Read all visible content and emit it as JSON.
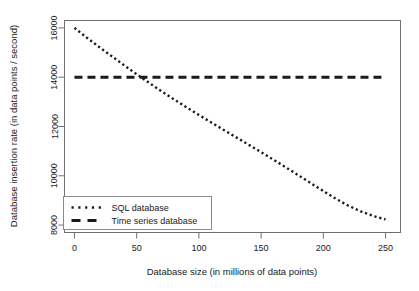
{
  "chart_data": {
    "type": "line",
    "title": "",
    "xlabel": "Database size (in millions of data points)",
    "ylabel": "Database insertion rate (in data points / second)",
    "xlim": [
      -8,
      262
    ],
    "ylim": [
      7700,
      16300
    ],
    "xticks": [
      0,
      50,
      100,
      150,
      200,
      250
    ],
    "xtick_labels": [
      "0",
      "50",
      "100",
      "150",
      "200",
      "250"
    ],
    "yticks": [
      8000,
      10000,
      12000,
      14000,
      16000
    ],
    "ytick_labels": [
      "8000",
      "10000",
      "12000",
      "14000",
      "16000"
    ],
    "grid": false,
    "legend_position": "bottom-left",
    "series": [
      {
        "name": "SQL database",
        "style": "dotted",
        "color": "#1a1a1a",
        "x": [
          0,
          10,
          20,
          30,
          40,
          50,
          60,
          70,
          80,
          90,
          100,
          110,
          120,
          130,
          140,
          150,
          160,
          170,
          180,
          190,
          200,
          210,
          220,
          230,
          240,
          250
        ],
        "y": [
          16000,
          15600,
          15220,
          14850,
          14480,
          14120,
          13770,
          13430,
          13100,
          12780,
          12470,
          12160,
          11860,
          11560,
          11260,
          10960,
          10650,
          10340,
          10020,
          9700,
          9380,
          9070,
          8790,
          8560,
          8370,
          8230
        ]
      },
      {
        "name": "Time series database",
        "style": "dashed",
        "color": "#1a1a1a",
        "x": [
          0,
          250
        ],
        "y": [
          14000,
          14000
        ]
      }
    ]
  },
  "legend": {
    "items": [
      {
        "label": "SQL database",
        "style": "dotted"
      },
      {
        "label": "Time series database",
        "style": "dashed"
      }
    ]
  }
}
